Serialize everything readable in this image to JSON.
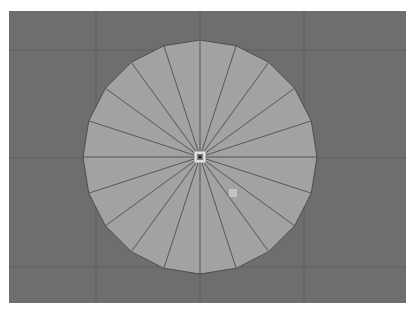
{
  "viewport": {
    "background": "#6e6e6e",
    "grid_color": "#5e5e5e",
    "grid_x": [
      87,
      191,
      295
    ],
    "grid_y": [
      39,
      147,
      256
    ]
  },
  "mesh": {
    "type": "disc",
    "segments": 20,
    "center": [
      191,
      146
    ],
    "radius": 117,
    "fill": "#a2a2a2",
    "edge_color": "#4e4e4e"
  },
  "pivot": {
    "position": [
      191,
      146
    ]
  },
  "handle_square": {
    "position": [
      224,
      182
    ],
    "size": 8,
    "color": "#c4c4c4"
  },
  "direction_marker": {
    "position": [
      191,
      197
    ]
  }
}
